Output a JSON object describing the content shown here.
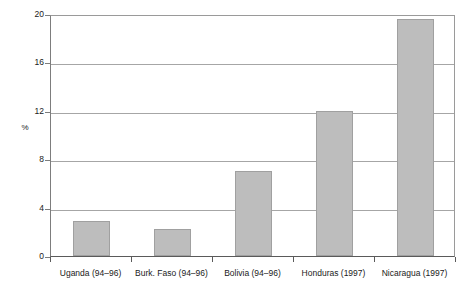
{
  "chart_data": {
    "type": "bar",
    "title": "",
    "subtitle": "",
    "xlabel": "",
    "ylabel": "%",
    "ylim": [
      0,
      20
    ],
    "ytick_labels": [
      "20",
      "16",
      "12",
      "8",
      "4",
      "0"
    ],
    "ytick_values": [
      20,
      16,
      12,
      8,
      4,
      0
    ],
    "grid": true,
    "legend": "none",
    "categories": [
      "Uganda (94–96)",
      "Burk. Faso (94–96)",
      "Bolivia (94–96)",
      "Honduras (1997)",
      "Nicaragua (1997)"
    ],
    "values": [
      2.9,
      2.2,
      7.0,
      12.0,
      19.6
    ],
    "bar_color": "#bdbdbd",
    "bar_border_color": "#a0a0a0",
    "axis_color": "#5a5a5a",
    "grid_color": "#a6a6a6",
    "background_color": "#ffffff",
    "annotations": []
  }
}
